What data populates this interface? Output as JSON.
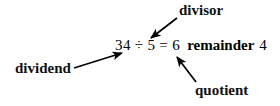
{
  "diagram": {
    "background_color": "#ffffff",
    "text_color": "#000000",
    "equation": {
      "dividend": "34",
      "division_sign": "÷",
      "divisor": "5",
      "equals_sign": "=",
      "quotient": "6",
      "remainder_word": "remainder",
      "remainder_value": "4",
      "full_text": "34 ÷ 5 = 6 remainder 4"
    },
    "labels": {
      "divisor": "divisor",
      "dividend": "dividend",
      "quotient": "quotient"
    },
    "arrows": [
      {
        "name": "divisor-arrow",
        "from_label": "divisor",
        "points_to": "5",
        "x1": 177,
        "y1": 18,
        "x2": 151,
        "y2": 38
      },
      {
        "name": "dividend-arrow",
        "from_label": "dividend",
        "points_to": "34",
        "x1": 74,
        "y1": 68,
        "x2": 122,
        "y2": 53
      },
      {
        "name": "quotient-arrow",
        "from_label": "quotient",
        "points_to": "6",
        "x1": 196,
        "y1": 82,
        "x2": 177,
        "y2": 57
      }
    ]
  }
}
